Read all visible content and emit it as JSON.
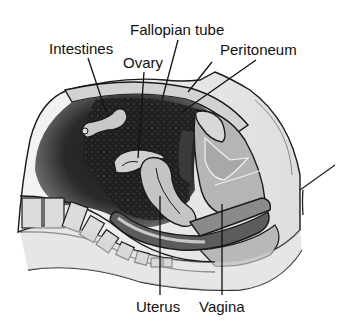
{
  "labels": {
    "intestines": "Intestines",
    "ovary": "Ovary",
    "fallopian_tube": "Fallopian tube",
    "peritoneum": "Peritoneum",
    "uterus": "Uterus",
    "vagina": "Vagina"
  },
  "colors": {
    "background": "#ffffff",
    "cavity": "#1e1e1e",
    "tissue_light": "#c8c8c8",
    "tissue_mid": "#a9a9a9",
    "tissue_dark": "#5a5a5a",
    "bone": "#dcdcdc",
    "skin": "#e6e6e6",
    "ink": "#111111"
  }
}
